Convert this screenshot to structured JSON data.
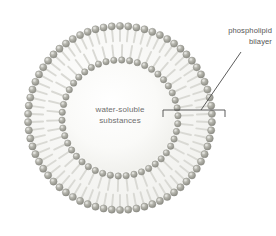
{
  "figure": {
    "type": "liposome-cross-section-diagram",
    "background_color": "#ffffff",
    "width": 276,
    "height": 236
  },
  "lumen": {
    "line1": "water-soluble",
    "line2": "substances",
    "text_color": "#6e6e6e",
    "fill_color": "#fbfbfa"
  },
  "callout": {
    "line1": "phospholipid",
    "line2": "bilayer",
    "text_color": "#555555",
    "bracket_color": "#4a4a4a",
    "leader_color": "#4a4a4a"
  },
  "structure": {
    "head_color": "#a9a9a2",
    "head_highlight_color": "#e2e2dd",
    "head_shadow_color": "#8a8a83",
    "tail_color": "#d9d9d4",
    "center_x": 120,
    "center_y": 118,
    "outer_head_radius": 92,
    "inner_head_radius": 58,
    "outer_head_count": 70,
    "inner_head_count": 46,
    "head_size": 7.2,
    "inner_head_size": 6.4
  },
  "geometry": {
    "bracket_left_x": 163,
    "bracket_right_x": 225,
    "bracket_y": 110,
    "bracket_tick_height": 7,
    "leader_x1": 201,
    "leader_y1": 110,
    "leader_x2": 241,
    "leader_y2": 52
  }
}
